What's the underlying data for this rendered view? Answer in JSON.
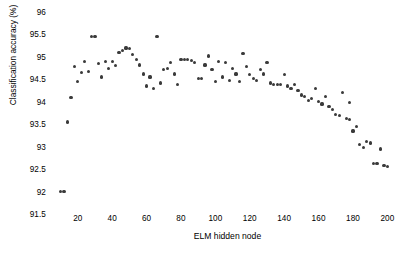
{
  "chart_data": {
    "type": "scatter",
    "title": "",
    "xlabel": "ELM hidden node",
    "ylabel": "Classification accuracy (%)",
    "xlim": [
      5,
      205
    ],
    "ylim": [
      91.5,
      96
    ],
    "xticks": [
      20,
      40,
      60,
      80,
      100,
      120,
      140,
      160,
      180,
      200
    ],
    "yticks": [
      91.5,
      92,
      92.5,
      93,
      93.5,
      94,
      94.5,
      95,
      95.5,
      96
    ],
    "grid": false,
    "legend": null,
    "marker_color": "#3a3a3a",
    "background_color": "#ffffff",
    "series": [
      {
        "name": "Classification accuracy vs ELM hidden node",
        "points": [
          [
            10,
            92.0
          ],
          [
            12,
            92.0
          ],
          [
            14,
            93.55
          ],
          [
            16,
            94.1
          ],
          [
            20,
            94.45
          ],
          [
            22,
            94.65
          ],
          [
            24,
            94.9
          ],
          [
            28,
            95.45
          ],
          [
            30,
            95.45
          ],
          [
            32,
            94.85
          ],
          [
            34,
            94.55
          ],
          [
            36,
            94.9
          ],
          [
            38,
            94.75
          ],
          [
            42,
            94.8
          ],
          [
            44,
            95.1
          ],
          [
            46,
            95.15
          ],
          [
            48,
            95.2
          ],
          [
            50,
            95.18
          ],
          [
            52,
            95.05
          ],
          [
            56,
            94.82
          ],
          [
            58,
            94.62
          ],
          [
            62,
            94.55
          ],
          [
            66,
            95.45
          ],
          [
            70,
            94.72
          ],
          [
            72,
            94.75
          ],
          [
            74,
            94.88
          ],
          [
            76,
            94.62
          ],
          [
            80,
            94.95
          ],
          [
            82,
            94.95
          ],
          [
            84,
            94.95
          ],
          [
            86,
            94.92
          ],
          [
            88,
            94.88
          ],
          [
            90,
            94.52
          ],
          [
            92,
            94.52
          ],
          [
            94,
            94.82
          ],
          [
            96,
            95.02
          ],
          [
            98,
            94.72
          ],
          [
            100,
            94.45
          ],
          [
            104,
            94.55
          ],
          [
            106,
            94.88
          ],
          [
            110,
            94.75
          ],
          [
            112,
            94.62
          ],
          [
            116,
            95.08
          ],
          [
            118,
            94.78
          ],
          [
            120,
            94.6
          ],
          [
            122,
            94.52
          ],
          [
            124,
            94.48
          ],
          [
            126,
            94.72
          ],
          [
            128,
            94.62
          ],
          [
            130,
            94.88
          ],
          [
            132,
            94.42
          ],
          [
            134,
            94.38
          ],
          [
            136,
            94.38
          ],
          [
            138,
            94.38
          ],
          [
            140,
            94.6
          ],
          [
            142,
            94.35
          ],
          [
            144,
            94.3
          ],
          [
            146,
            94.38
          ],
          [
            148,
            94.25
          ],
          [
            150,
            94.15
          ],
          [
            152,
            94.12
          ],
          [
            154,
            94.02
          ],
          [
            156,
            94.08
          ],
          [
            158,
            94.3
          ],
          [
            160,
            94.0
          ],
          [
            162,
            93.95
          ],
          [
            164,
            94.12
          ],
          [
            166,
            93.9
          ],
          [
            168,
            93.82
          ],
          [
            170,
            93.72
          ],
          [
            172,
            93.7
          ],
          [
            174,
            94.2
          ],
          [
            176,
            93.62
          ],
          [
            178,
            93.6
          ],
          [
            180,
            93.35
          ],
          [
            182,
            93.45
          ],
          [
            184,
            93.05
          ],
          [
            186,
            92.98
          ],
          [
            188,
            93.12
          ],
          [
            190,
            93.08
          ],
          [
            192,
            92.62
          ],
          [
            194,
            92.62
          ],
          [
            196,
            92.95
          ],
          [
            198,
            92.58
          ],
          [
            200,
            92.55
          ],
          [
            18,
            94.78
          ],
          [
            26,
            94.68
          ],
          [
            40,
            94.9
          ],
          [
            54,
            94.95
          ],
          [
            60,
            94.35
          ],
          [
            64,
            94.3
          ],
          [
            68,
            94.42
          ],
          [
            78,
            94.38
          ],
          [
            102,
            94.9
          ],
          [
            108,
            94.48
          ],
          [
            114,
            94.45
          ],
          [
            178,
            93.98
          ]
        ]
      }
    ]
  },
  "axes": {
    "y_tick_labels": [
      "96",
      "95.5",
      "95",
      "94.5",
      "94",
      "93.5",
      "93",
      "92.5",
      "92",
      "91.5"
    ],
    "x_tick_labels": [
      "20",
      "40",
      "60",
      "80",
      "100",
      "120",
      "140",
      "160",
      "180",
      "200"
    ]
  }
}
